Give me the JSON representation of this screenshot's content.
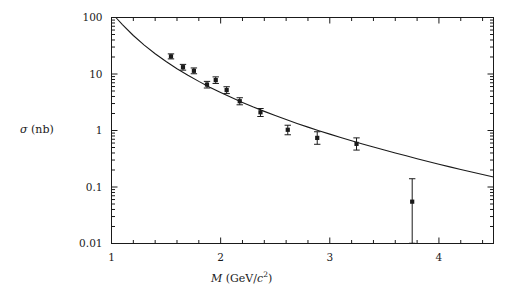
{
  "figure": {
    "background": "#ffffff",
    "ink_color": "#1a1a1a"
  },
  "labels": {
    "y_axis_sigma": "σ",
    "y_axis_unit": "(nb)",
    "x_axis_symbol": "M",
    "x_axis_unit_open": "(GeV/",
    "x_axis_unit_c": "c",
    "x_axis_unit_exp": "2",
    "x_axis_unit_close": ")"
  },
  "chart_data": {
    "type": "scatter",
    "title": "",
    "xlabel": "M (GeV/c^2)",
    "ylabel": "σ (nb)",
    "xscale": "linear",
    "yscale": "log",
    "xlim": [
      1,
      4.5
    ],
    "ylim": [
      0.01,
      100
    ],
    "grid": false,
    "legend": null,
    "x_ticks_major": [
      1,
      2,
      3,
      4
    ],
    "x_tick_labels": [
      "1",
      "2",
      "3",
      "4"
    ],
    "x_ticks_minor": [
      1.2,
      1.4,
      1.6,
      1.8,
      2.2,
      2.4,
      2.6,
      2.8,
      3.2,
      3.4,
      3.6,
      3.8,
      4.2,
      4.4
    ],
    "y_ticks_major": [
      0.01,
      0.1,
      1,
      10,
      100
    ],
    "y_tick_labels": [
      "0.01",
      "0.1",
      "1",
      "10",
      "100"
    ],
    "series": [
      {
        "name": "measured cross section",
        "type": "scatter_errorbar",
        "marker": "filled-square",
        "points": [
          {
            "x": 1.545,
            "y": 20.5,
            "yerr_low": 2.0,
            "yerr_high": 2.2
          },
          {
            "x": 1.655,
            "y": 13.2,
            "yerr_low": 1.5,
            "yerr_high": 1.6
          },
          {
            "x": 1.755,
            "y": 11.4,
            "yerr_low": 1.3,
            "yerr_high": 1.4
          },
          {
            "x": 1.875,
            "y": 6.5,
            "yerr_low": 0.85,
            "yerr_high": 0.9
          },
          {
            "x": 1.955,
            "y": 7.8,
            "yerr_low": 1.0,
            "yerr_high": 1.1
          },
          {
            "x": 2.055,
            "y": 5.2,
            "yerr_low": 0.7,
            "yerr_high": 0.75
          },
          {
            "x": 2.175,
            "y": 3.3,
            "yerr_low": 0.45,
            "yerr_high": 0.5
          },
          {
            "x": 2.365,
            "y": 2.1,
            "yerr_low": 0.33,
            "yerr_high": 0.35
          },
          {
            "x": 2.615,
            "y": 1.03,
            "yerr_low": 0.19,
            "yerr_high": 0.21
          },
          {
            "x": 2.885,
            "y": 0.74,
            "yerr_low": 0.17,
            "yerr_high": 0.21
          },
          {
            "x": 3.245,
            "y": 0.58,
            "yerr_low": 0.13,
            "yerr_high": 0.16
          },
          {
            "x": 3.755,
            "y": 0.055,
            "yerr_low": 0.0449,
            "yerr_high": 0.085
          }
        ]
      },
      {
        "name": "theory curve",
        "type": "line",
        "x": [
          1.04,
          1.1,
          1.2,
          1.3,
          1.4,
          1.5,
          1.6,
          1.7,
          1.8,
          1.9,
          2.0,
          2.1,
          2.2,
          2.3,
          2.4,
          2.5,
          2.6,
          2.7,
          2.8,
          2.9,
          3.0,
          3.1,
          3.2,
          3.3,
          3.4,
          3.5,
          3.6,
          3.7,
          3.8,
          3.9,
          4.0,
          4.1,
          4.2,
          4.3,
          4.4,
          4.5
        ],
        "y": [
          100.0,
          75.0,
          48.0,
          32.5,
          22.8,
          16.6,
          12.4,
          9.5,
          7.4,
          5.85,
          4.7,
          3.82,
          3.14,
          2.6,
          2.18,
          1.84,
          1.56,
          1.335,
          1.148,
          0.993,
          0.863,
          0.752,
          0.659,
          0.579,
          0.51,
          0.451,
          0.4,
          0.356,
          0.317,
          0.283,
          0.253,
          0.227,
          0.204,
          0.184,
          0.166,
          0.15
        ]
      }
    ]
  }
}
